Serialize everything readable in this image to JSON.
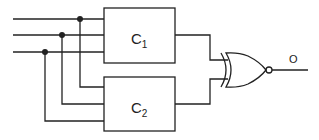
{
  "diagram": {
    "type": "logic-circuit",
    "inputs": [
      "input-1",
      "input-2",
      "input-3"
    ],
    "blocks": [
      {
        "id": "C1",
        "label": "C",
        "subscript": "1"
      },
      {
        "id": "C2",
        "label": "C",
        "subscript": "2"
      }
    ],
    "gate": {
      "type": "XNOR"
    },
    "output": {
      "label": "O"
    },
    "colors": {
      "line": "#222222",
      "background": "#ffffff"
    }
  }
}
